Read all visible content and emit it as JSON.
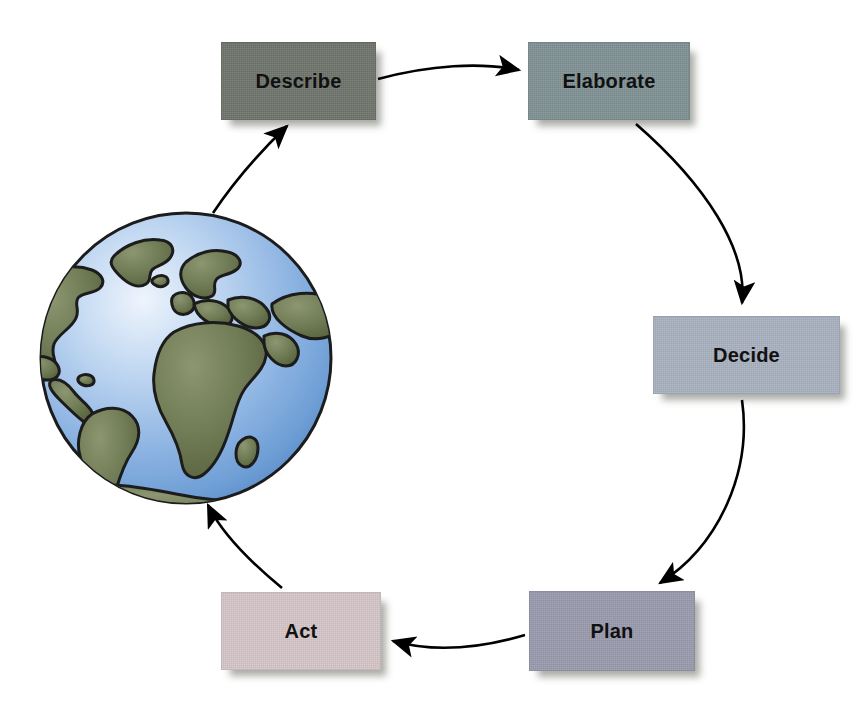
{
  "diagram": {
    "background_color": "#ffffff",
    "arrow_color": "#000000",
    "nodes": [
      {
        "id": "describe",
        "label": "Describe",
        "color": "#6e736b",
        "text_color": "#111111"
      },
      {
        "id": "elaborate",
        "label": "Elaborate",
        "color": "#7f9194",
        "text_color": "#111111"
      },
      {
        "id": "decide",
        "label": "Decide",
        "color": "#a9b1c1",
        "text_color": "#111111"
      },
      {
        "id": "plan",
        "label": "Plan",
        "color": "#9a9aae",
        "text_color": "#111111"
      },
      {
        "id": "act",
        "label": "Act",
        "color": "#d5c6c9",
        "text_color": "#111111"
      }
    ],
    "edges": [
      {
        "id": "describe-to-elaborate",
        "from": "describe",
        "to": "elaborate"
      },
      {
        "id": "elaborate-to-decide",
        "from": "elaborate",
        "to": "decide"
      },
      {
        "id": "decide-to-plan",
        "from": "decide",
        "to": "plan"
      },
      {
        "id": "plan-to-act",
        "from": "plan",
        "to": "act"
      },
      {
        "id": "act-to-globe",
        "from": "act",
        "to": "globe"
      },
      {
        "id": "globe-to-describe",
        "from": "globe",
        "to": "describe"
      }
    ],
    "globe": {
      "name": "earth-globe",
      "ocean_color": "#8fb4e0",
      "ocean_highlight": "#e8f1fb",
      "land_color": "#6e7a54",
      "outline_color": "#1c1c1c"
    }
  }
}
